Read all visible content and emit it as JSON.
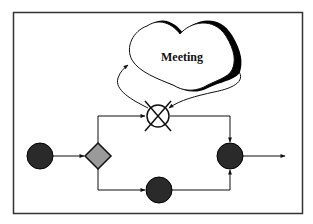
{
  "diagram": {
    "type": "process-flow",
    "cloud": {
      "label": "Meeting"
    },
    "nodes": [
      {
        "id": "start",
        "shape": "circle",
        "fill": "#2a2a2a"
      },
      {
        "id": "decision",
        "shape": "diamond",
        "fill": "#9a9a9a"
      },
      {
        "id": "cancelled-activity",
        "shape": "crossed-circle",
        "fill": "#ffffff"
      },
      {
        "id": "activity",
        "shape": "circle",
        "fill": "#2a2a2a"
      },
      {
        "id": "merge",
        "shape": "circle",
        "fill": "#2a2a2a"
      }
    ],
    "edges": [
      {
        "from": "start",
        "to": "decision"
      },
      {
        "from": "decision",
        "to": "cancelled-activity"
      },
      {
        "from": "decision",
        "to": "activity"
      },
      {
        "from": "cancelled-activity",
        "to": "cloud"
      },
      {
        "from": "cloud",
        "to": "cancelled-activity"
      },
      {
        "from": "cancelled-activity",
        "to": "merge"
      },
      {
        "from": "activity",
        "to": "merge"
      },
      {
        "from": "merge",
        "to": "output"
      }
    ],
    "colors": {
      "stroke": "#111111",
      "frame": "#333333",
      "node_dark": "#2a2a2a",
      "diamond": "#9a9a9a"
    }
  }
}
